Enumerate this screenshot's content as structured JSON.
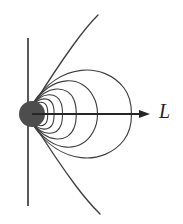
{
  "figure": {
    "background_color": "#ffffff",
    "width": 183,
    "height": 224,
    "axis_label": "L",
    "axis_label_style": "italic-serif",
    "colors": {
      "planet_fill": "#4d4d4d",
      "field_line": "#3f3f3f",
      "axis_line": "#3b3b3b",
      "arrow": "#262626",
      "background": "#ffffff"
    },
    "planet": {
      "name": "central-dipole-body",
      "center_x": 32,
      "center_y": 114,
      "radius": 13,
      "fill": "#4d4d4d"
    },
    "vertical_axis": {
      "name": "rotation-axis",
      "x": 28,
      "y_top": 38,
      "y_bottom": 206
    },
    "horizontal_arrow": {
      "name": "L-axis-arrow",
      "x_start": 32,
      "x_end": 150,
      "y": 114,
      "head_length": 9,
      "head_width": 7,
      "direction": "right"
    },
    "closed_field_lines": [
      {
        "id": 1,
        "apex_x": 44,
        "half_height": 8
      },
      {
        "id": 2,
        "apex_x": 50,
        "half_height": 13
      },
      {
        "id": 3,
        "apex_x": 58,
        "half_height": 19
      },
      {
        "id": 4,
        "apex_x": 70,
        "half_height": 26
      },
      {
        "id": 5,
        "apex_x": 90,
        "half_height": 35
      },
      {
        "id": 6,
        "apex_x": 130,
        "half_height": 48
      }
    ],
    "open_field_lines": [
      {
        "id": "upper-outer",
        "end_x": 98,
        "end_y": 15
      },
      {
        "id": "lower-outer",
        "end_x": 100,
        "end_y": 214
      }
    ]
  }
}
